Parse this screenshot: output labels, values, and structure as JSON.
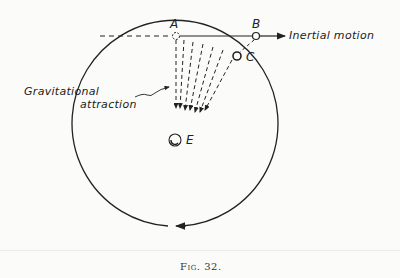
{
  "figure": {
    "caption": "Fig. 32.",
    "labels": {
      "point_a": "A",
      "point_b": "B",
      "point_c": "C",
      "point_e": "E",
      "inertial_motion": "Inertial motion",
      "gravitational_line1": "Gravitational",
      "gravitational_line2": "attraction"
    },
    "colors": {
      "ink": "#222222",
      "paper": "#fbfbfa"
    }
  }
}
